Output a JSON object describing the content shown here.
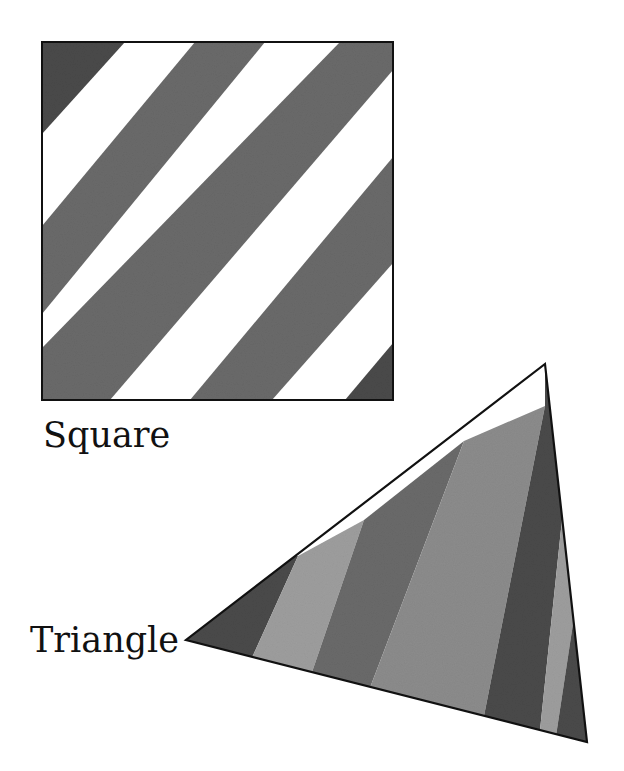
{
  "labels": {
    "square": "Square",
    "triangle": "Triangle"
  },
  "shapes": [
    {
      "name": "square",
      "pattern": "diagonal stripes",
      "stripe_count": 5
    },
    {
      "name": "triangle",
      "pattern": "diagonal stripes",
      "stripe_count": 7
    }
  ],
  "colors": {
    "outline": "#111111",
    "stripe_dark": "#4a4a4a",
    "stripe_mid": "#6a6a6a",
    "stripe_light": "#8c8c8c",
    "stripe_lighter": "#9e9e9e",
    "background": "#ffffff"
  }
}
